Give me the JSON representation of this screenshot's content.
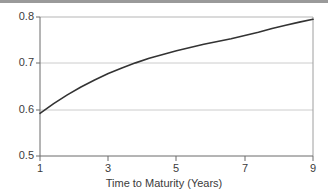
{
  "chart_data": {
    "type": "line",
    "title": "",
    "subtitle": "",
    "xlabel": "Time to Maturity (Years)",
    "ylabel": "",
    "xlim": [
      1,
      9
    ],
    "ylim": [
      0.5,
      0.8
    ],
    "xticks": [
      1,
      3,
      5,
      7,
      9
    ],
    "xtick_labels": [
      "1",
      "3",
      "5",
      "7",
      "9"
    ],
    "yticks": [
      0.5,
      0.6,
      0.7,
      0.8
    ],
    "ytick_labels": [
      "0.5",
      "0.6",
      "0.7",
      "0.8"
    ],
    "grid": "horizontal",
    "legend": "none",
    "annotations": [],
    "series": [
      {
        "name": "curve",
        "color": "#333333",
        "x": [
          1.0,
          1.4,
          1.8,
          2.2,
          2.6,
          3.0,
          3.4,
          3.8,
          4.2,
          4.6,
          5.0,
          5.4,
          5.8,
          6.2,
          6.6,
          7.0,
          7.4,
          7.8,
          8.2,
          8.6,
          9.0
        ],
        "values": [
          0.592,
          0.613,
          0.632,
          0.649,
          0.664,
          0.678,
          0.69,
          0.701,
          0.711,
          0.719,
          0.727,
          0.734,
          0.741,
          0.747,
          0.753,
          0.76,
          0.767,
          0.775,
          0.782,
          0.789,
          0.795
        ]
      }
    ]
  },
  "style": {
    "axis_color": "#6b6b6b",
    "grid_color": "#cccccc",
    "curve_color": "#333333",
    "text_color": "#3b3b3b",
    "top_band_color": "#9a9a9a",
    "background": "#ffffff"
  },
  "geometry": {
    "plot_left": 40,
    "plot_right": 313,
    "plot_top": 17,
    "plot_bottom": 156
  }
}
